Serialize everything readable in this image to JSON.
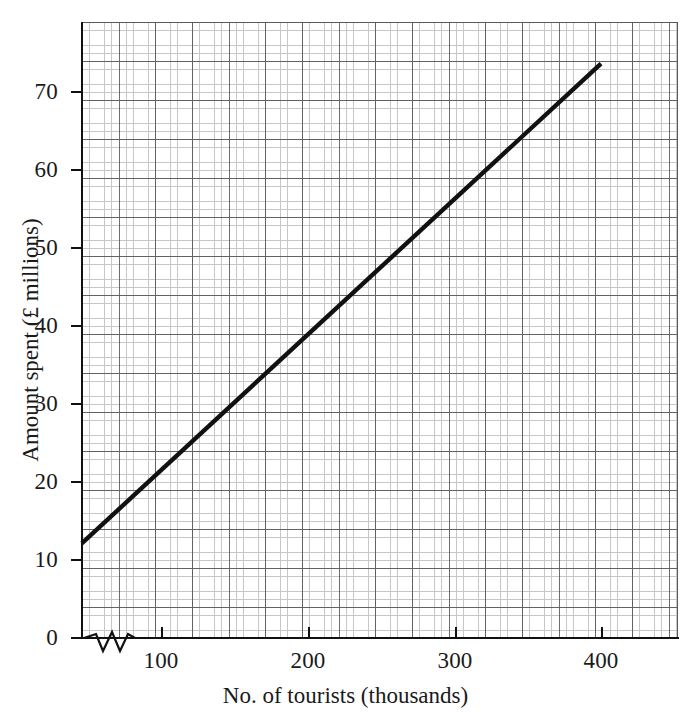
{
  "chart_data": {
    "type": "line",
    "title": "",
    "xlabel": "No. of tourists (thousands)",
    "ylabel": "Amount spent (£ millions)",
    "xlim": [
      46,
      450
    ],
    "ylim": [
      0,
      79
    ],
    "x_ticks": [
      100,
      200,
      300,
      400
    ],
    "y_ticks": [
      0,
      10,
      20,
      30,
      40,
      50,
      60,
      70
    ],
    "x_tick_labels": [
      "100",
      "200",
      "300",
      "400"
    ],
    "y_tick_labels": [
      "0",
      "10",
      "20",
      "30",
      "40",
      "50",
      "60",
      "70"
    ],
    "x_major_grid_step": 25,
    "x_minor_grid_step": 5,
    "y_major_grid_step": 5,
    "y_minor_grid_step": 1,
    "grid": true,
    "legend": false,
    "x_axis_break": true,
    "x_axis_break_note": "zigzag break symbol between 0 and first gridline",
    "series": [
      {
        "name": "Amount spent vs no. of tourists",
        "color": "#111111",
        "x": [
          46,
          100,
          150,
          200,
          250,
          300,
          350,
          400
        ],
        "values": [
          12.0,
          21.4,
          30.1,
          38.8,
          47.5,
          56.2,
          64.8,
          73.5
        ]
      }
    ],
    "annotations": []
  },
  "axis_labels": {
    "x_title": "No. of tourists (thousands)",
    "y_title": "Amount spent (£ millions)"
  },
  "colors": {
    "data_line": "#111111",
    "axis": "#111111",
    "grid_major": "#4a4a4a",
    "grid_minor": "#9a9a9a",
    "background": "#ffffff"
  }
}
